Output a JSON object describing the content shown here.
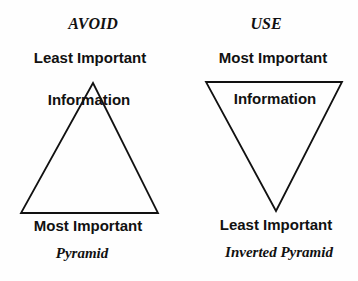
{
  "diagram": {
    "left": {
      "heading": "AVOID",
      "top_label": "Least Important",
      "middle_label": "Information",
      "bottom_label": "Most Important",
      "caption": "Pyramid",
      "shape": "triangle-up"
    },
    "right": {
      "heading": "USE",
      "top_label": "Most Important",
      "middle_label": "Information",
      "bottom_label": "Least Important",
      "caption": "Inverted Pyramid",
      "shape": "triangle-down"
    },
    "colors": {
      "stroke": "#111111",
      "background": "#fefefe"
    }
  }
}
